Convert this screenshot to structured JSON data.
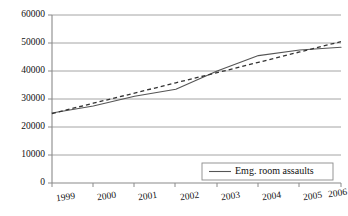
{
  "chart_data": {
    "type": "line",
    "title": "",
    "subtitle": "",
    "xlabel": "",
    "ylabel": "",
    "categories": [
      "1999",
      "2000",
      "2001",
      "2002",
      "2003",
      "2004",
      "2005",
      "2006"
    ],
    "series": [
      {
        "name": "Emg. room assaults",
        "style": "solid",
        "color": "#555555",
        "values": [
          25000,
          27500,
          31000,
          33500,
          40000,
          45500,
          47500,
          48500
        ]
      },
      {
        "name": "Linear trendline",
        "style": "dashed",
        "color": "#333333",
        "values": [
          24800,
          28500,
          32100,
          35800,
          39400,
          43100,
          46800,
          50500
        ]
      }
    ],
    "ylim": [
      0,
      60000
    ],
    "yticks": [
      0,
      10000,
      20000,
      30000,
      40000,
      50000,
      60000
    ],
    "ytick_labels": [
      "0",
      "10000",
      "20000",
      "30000",
      "40000",
      "50000",
      "60000"
    ],
    "xtick_labels": [
      "1999",
      "2000",
      "2001",
      "2002",
      "2003",
      "2004",
      "2005",
      "2006"
    ],
    "grid": "horizontal",
    "legend_position": "bottom-right",
    "legend_entries": [
      "Emg. room assaults"
    ],
    "axis_color": "#8a8a8a",
    "grid_color": "#9a9a9a",
    "background_color": "#ffffff"
  },
  "legend": {
    "entry_label": "Emg. room assaults"
  },
  "axes": {
    "y_labels": [
      "60000",
      "50000",
      "40000",
      "30000",
      "20000",
      "10000",
      "0"
    ],
    "x_labels": [
      "1999",
      "2000",
      "2001",
      "2002",
      "2003",
      "2004",
      "2005",
      "2006"
    ]
  }
}
